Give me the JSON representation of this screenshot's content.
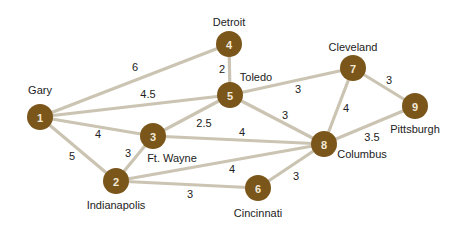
{
  "colors": {
    "node_fill": "#7a561b",
    "node_text": "#f3ead8",
    "edge": "#cbc4b3",
    "text": "#222222"
  },
  "nodes": [
    {
      "id": "1",
      "city": "Gary",
      "x": 40,
      "y": 117,
      "lx": 40,
      "ly": 90
    },
    {
      "id": "2",
      "city": "Indianapolis",
      "x": 116,
      "y": 181,
      "lx": 116,
      "ly": 205
    },
    {
      "id": "3",
      "city": "Ft. Wayne",
      "x": 153,
      "y": 136,
      "lx": 172,
      "ly": 158
    },
    {
      "id": "4",
      "city": "Detroit",
      "x": 229,
      "y": 44,
      "lx": 229,
      "ly": 22
    },
    {
      "id": "5",
      "city": "Toledo",
      "x": 230,
      "y": 95,
      "lx": 256,
      "ly": 77
    },
    {
      "id": "6",
      "city": "Cincinnati",
      "x": 258,
      "y": 188,
      "lx": 258,
      "ly": 213
    },
    {
      "id": "7",
      "city": "Cleveland",
      "x": 353,
      "y": 68,
      "lx": 353,
      "ly": 47
    },
    {
      "id": "8",
      "city": "Columbus",
      "x": 324,
      "y": 144,
      "lx": 362,
      "ly": 154
    },
    {
      "id": "9",
      "city": "Pittsburgh",
      "x": 415,
      "y": 106,
      "lx": 415,
      "ly": 129
    }
  ],
  "edges": [
    {
      "from": "1",
      "to": "4",
      "weight": "6",
      "wx": 135,
      "wy": 67
    },
    {
      "from": "1",
      "to": "5",
      "weight": "4.5",
      "wx": 148,
      "wy": 94
    },
    {
      "from": "1",
      "to": "3",
      "weight": "4",
      "wx": 98,
      "wy": 134
    },
    {
      "from": "1",
      "to": "2",
      "weight": "5",
      "wx": 72,
      "wy": 156
    },
    {
      "from": "4",
      "to": "5",
      "weight": "2",
      "wx": 222,
      "wy": 69
    },
    {
      "from": "5",
      "to": "3",
      "weight": "2.5",
      "wx": 204,
      "wy": 123
    },
    {
      "from": "5",
      "to": "7",
      "weight": "3",
      "wx": 298,
      "wy": 89
    },
    {
      "from": "5",
      "to": "8",
      "weight": "3",
      "wx": 285,
      "wy": 115
    },
    {
      "from": "3",
      "to": "8",
      "weight": "4",
      "wx": 242,
      "wy": 132
    },
    {
      "from": "3",
      "to": "2",
      "weight": "3",
      "wx": 128,
      "wy": 153
    },
    {
      "from": "2",
      "to": "8",
      "weight": "4",
      "wx": 232,
      "wy": 169
    },
    {
      "from": "2",
      "to": "6",
      "weight": "3",
      "wx": 190,
      "wy": 194
    },
    {
      "from": "6",
      "to": "8",
      "weight": "3",
      "wx": 296,
      "wy": 176
    },
    {
      "from": "7",
      "to": "8",
      "weight": "4",
      "wx": 346,
      "wy": 108
    },
    {
      "from": "7",
      "to": "9",
      "weight": "3",
      "wx": 389,
      "wy": 80
    },
    {
      "from": "8",
      "to": "9",
      "weight": "3.5",
      "wx": 372,
      "wy": 137
    }
  ]
}
